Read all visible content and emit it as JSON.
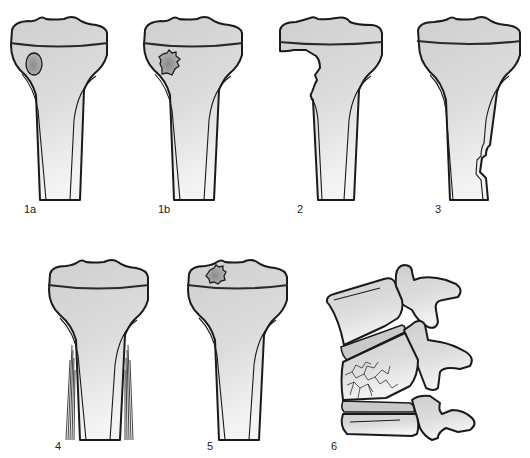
{
  "figure": {
    "background_color": "#ffffff",
    "bone_fill_color": "#d6d6d6",
    "outline_color": "#1a1a1a",
    "panels": [
      {
        "id": "1a",
        "label": "1a",
        "subject": "tibia",
        "feature": "smooth oval lesion in metaphysis"
      },
      {
        "id": "1b",
        "label": "1b",
        "subject": "tibia",
        "feature": "irregular lesion in metaphysis"
      },
      {
        "id": "2",
        "label": "2",
        "subject": "tibia",
        "feature": "destructive cortical defect of proximal metaphysis"
      },
      {
        "id": "3",
        "label": "3",
        "subject": "tibia",
        "feature": "cortical bulge along distal shaft"
      },
      {
        "id": "4",
        "label": "4",
        "subject": "tibia",
        "feature": "layered periosteal reaction along shaft"
      },
      {
        "id": "5",
        "label": "5",
        "subject": "tibia",
        "feature": "irregular lesion in epiphysis"
      },
      {
        "id": "6",
        "label": "6",
        "subject": "vertebrae",
        "feature": "collapsed fractured vertebral body between discs"
      }
    ]
  }
}
